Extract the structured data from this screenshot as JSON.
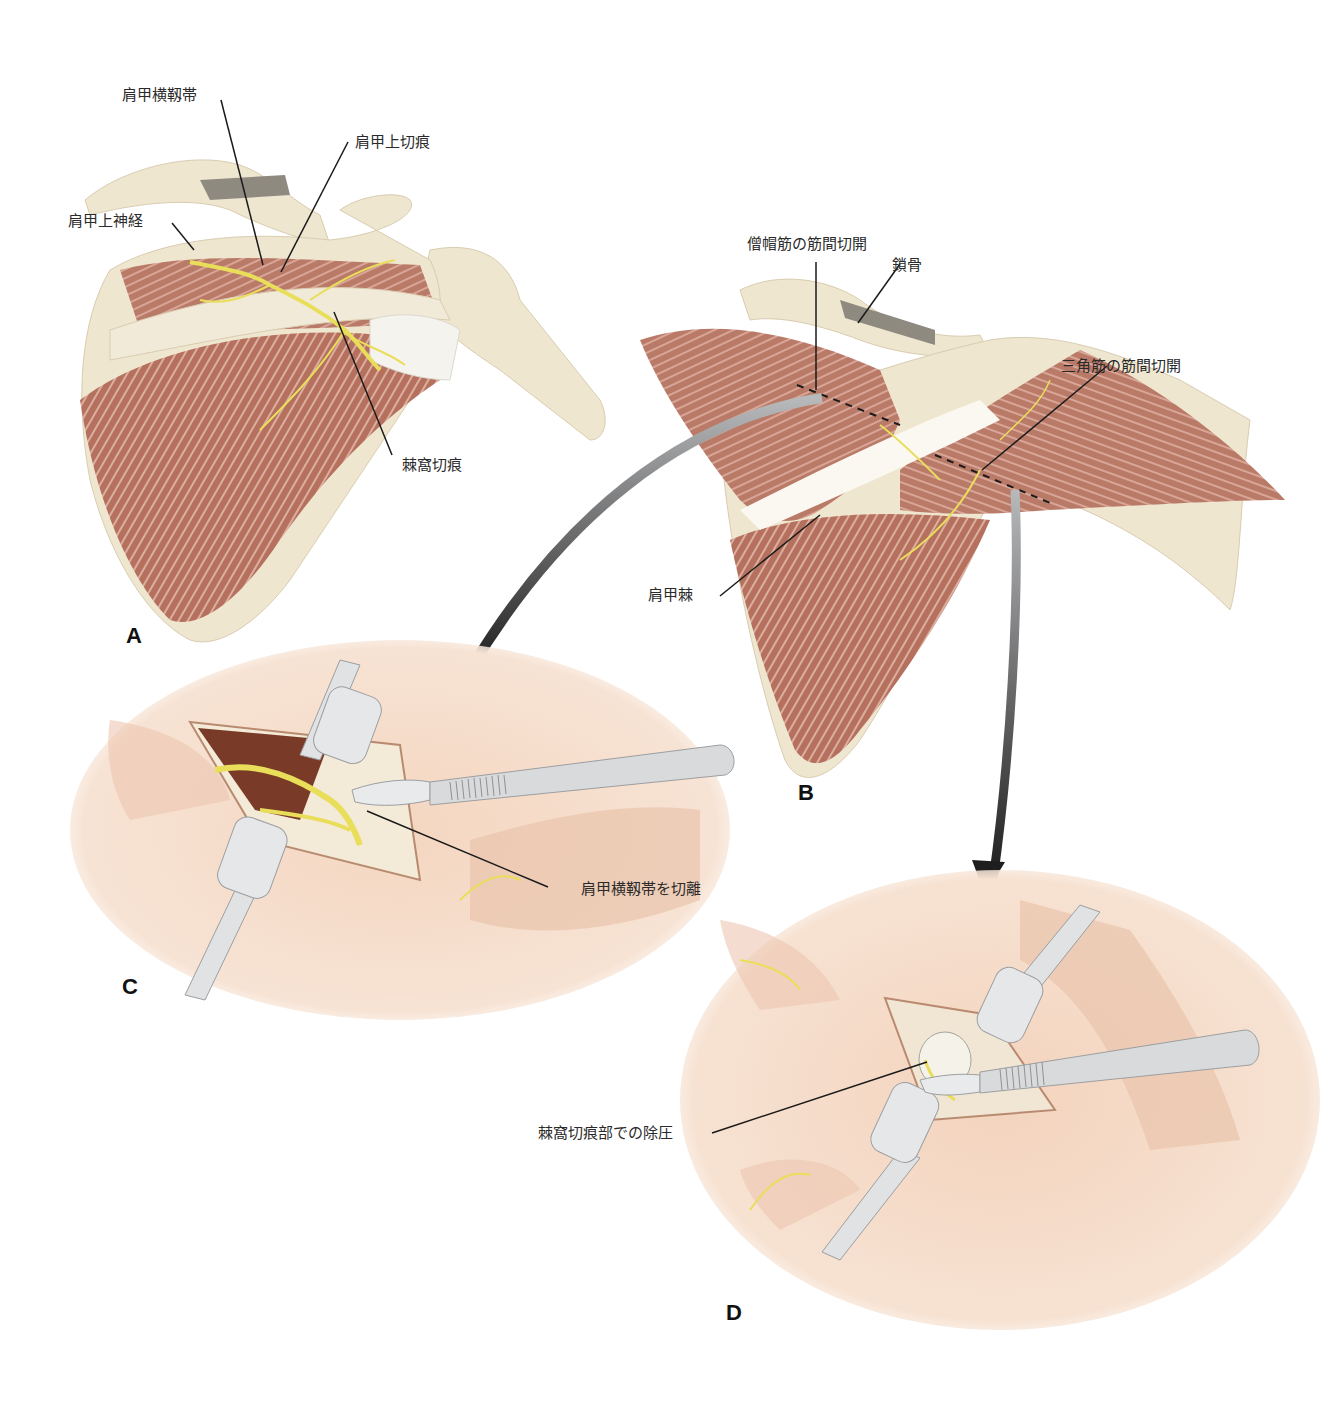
{
  "figure": {
    "colors": {
      "background": "#ffffff",
      "bone": "#efe6d0",
      "bone_shadow": "#d9ccb0",
      "muscle": "#b97a68",
      "muscle_light": "#d8a596",
      "nerve": "#e9de5a",
      "ligament": "#f6f3ec",
      "skin": "#f6dcc8",
      "skin_dark": "#e8bfa6",
      "instrument": "#d9dadb",
      "instrument_dark": "#9c9ea1",
      "arrow": "#3a3a3a",
      "leader_line": "#1a1a1a",
      "wound_cavity": "#7a3a28"
    },
    "panels": [
      {
        "id": "A",
        "letter": "A"
      },
      {
        "id": "B",
        "letter": "B"
      },
      {
        "id": "C",
        "letter": "C"
      },
      {
        "id": "D",
        "letter": "D"
      }
    ],
    "labels": {
      "a_transverse_scapular_ligament": "肩甲横靱帯",
      "a_suprascapular_notch": "肩甲上切痕",
      "a_suprascapular_nerve": "肩甲上神経",
      "a_spinoglenoid_notch": "棘窩切痕",
      "b_trapezius_split": "僧帽筋の筋間切開",
      "b_clavicle": "鎖骨",
      "b_deltoid_split": "三角筋の筋間切開",
      "b_scapular_spine": "肩甲棘",
      "c_release_ligament": "肩甲横靱帯を切離",
      "d_decompression": "棘窩切痕部での除圧"
    }
  }
}
